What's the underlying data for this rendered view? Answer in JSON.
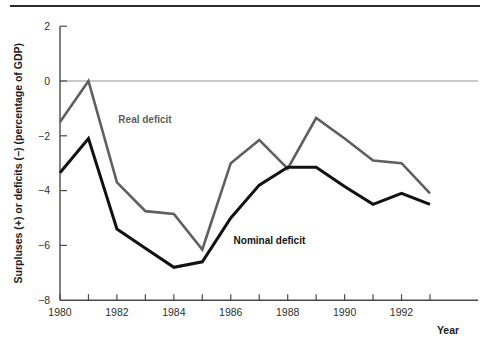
{
  "chart_data": {
    "type": "line",
    "title": "",
    "subtitle": "",
    "xlabel": "Year",
    "ylabel": "Surpluses (+) or deficits (−) (percentage of GDP)",
    "x": [
      1980,
      1981,
      1982,
      1983,
      1984,
      1985,
      1986,
      1987,
      1988,
      1989,
      1990,
      1991,
      1992,
      1993
    ],
    "xtick_labels": [
      "1980",
      "",
      "1982",
      "",
      "1984",
      "",
      "1986",
      "",
      "1988",
      "",
      "1990",
      "",
      "1992",
      ""
    ],
    "ytick_values": [
      2,
      0,
      -2,
      -4,
      -6,
      -8
    ],
    "ytick_labels": [
      "2",
      "0",
      "−2",
      "−4",
      "−6",
      "−8"
    ],
    "xlim": [
      1980,
      1993
    ],
    "ylim": [
      -8,
      2
    ],
    "grid": false,
    "zero_reference_line": true,
    "legend_position": "inline-annotations",
    "series": [
      {
        "name": "Real deficit",
        "color": "#5f5f5f",
        "width": 2.6,
        "annotation": {
          "text": "Real deficit",
          "x": 1982.05,
          "y": -1.55,
          "color": "#5f5f5f"
        },
        "values": [
          -1.5,
          0.0,
          -3.7,
          -4.75,
          -4.85,
          -6.15,
          -3.0,
          -2.15,
          -3.2,
          -1.35,
          -2.1,
          -2.9,
          -3.0,
          -4.1
        ]
      },
      {
        "name": "Nominal deficit",
        "color": "#121212",
        "width": 3.0,
        "annotation": {
          "text": "Nominal deficit",
          "x": 1986.1,
          "y": -5.95,
          "color": "#121212"
        },
        "values": [
          -3.35,
          -2.1,
          -5.4,
          -6.1,
          -6.8,
          -6.6,
          -5.0,
          -3.8,
          -3.15,
          -3.15,
          -3.85,
          -4.5,
          -4.1,
          -4.5
        ]
      }
    ]
  }
}
